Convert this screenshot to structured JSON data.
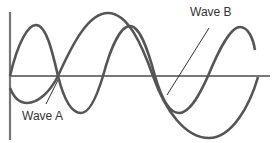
{
  "diagram": {
    "title": "",
    "labels": {
      "wave_a": "Wave A",
      "wave_b": "Wave B"
    },
    "colors": {
      "wave": "#555555",
      "axis": "#777777",
      "leader": "#333333",
      "text": "#333333"
    },
    "waves": [
      {
        "name": "Wave A",
        "description": "shorter wavelength, smaller amplitude"
      },
      {
        "name": "Wave B",
        "description": "longer wavelength, larger amplitude"
      }
    ]
  }
}
